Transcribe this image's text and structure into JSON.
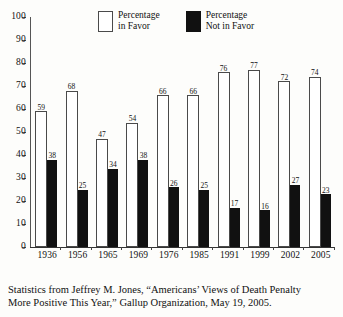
{
  "chart_data": {
    "type": "bar",
    "title": "",
    "subtitle": "",
    "xlabel": "",
    "ylabel": "",
    "ylim": [
      0,
      100
    ],
    "ytick_step": 10,
    "yticks": [
      0,
      10,
      20,
      30,
      40,
      50,
      60,
      70,
      80,
      90,
      100
    ],
    "grid": false,
    "legend_position": "top-center",
    "categories": [
      "1936",
      "1956",
      "1965",
      "1969",
      "1976",
      "1985",
      "1991",
      "1999",
      "2002",
      "2005"
    ],
    "series": [
      {
        "name": "Percentage in Favor",
        "color": "#ffffff",
        "edge_color": "#4a4a4a",
        "values": [
          59,
          68,
          47,
          54,
          66,
          66,
          76,
          77,
          72,
          74
        ]
      },
      {
        "name": "Percentage Not in Favor",
        "color": "#111111",
        "edge_color": "#111111",
        "values": [
          38,
          25,
          34,
          38,
          26,
          25,
          17,
          16,
          27,
          23
        ]
      }
    ]
  },
  "legend": {
    "items": [
      {
        "label": "Percentage\nin Favor",
        "swatch": "white-open-box"
      },
      {
        "label": "Percentage\nNot in Favor",
        "swatch": "black-filled-box"
      }
    ]
  },
  "caption": {
    "line1": "Statistics from Jeffrey M. Jones, “Americans’ Views of Death Penalty",
    "line2": "More Positive This Year,” Gallup Organization, May 19, 2005."
  }
}
